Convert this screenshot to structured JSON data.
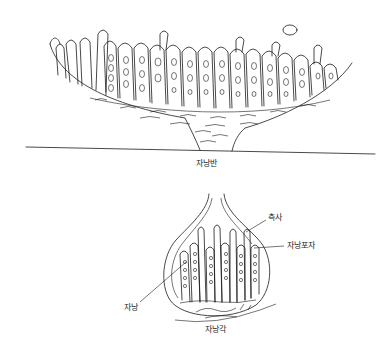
{
  "figure": {
    "top_diagram": {
      "name": "apothecium",
      "label": "자낭반"
    },
    "bottom_diagram": {
      "name": "perithecium",
      "label": "자낭각",
      "callouts": [
        {
          "id": "paraphysis",
          "text": "측사"
        },
        {
          "id": "ascospore",
          "text": "자낭포자"
        },
        {
          "id": "ascus",
          "text": "자낭"
        }
      ]
    },
    "colors": {
      "line": "#1a1a1a",
      "background": "#ffffff"
    }
  }
}
